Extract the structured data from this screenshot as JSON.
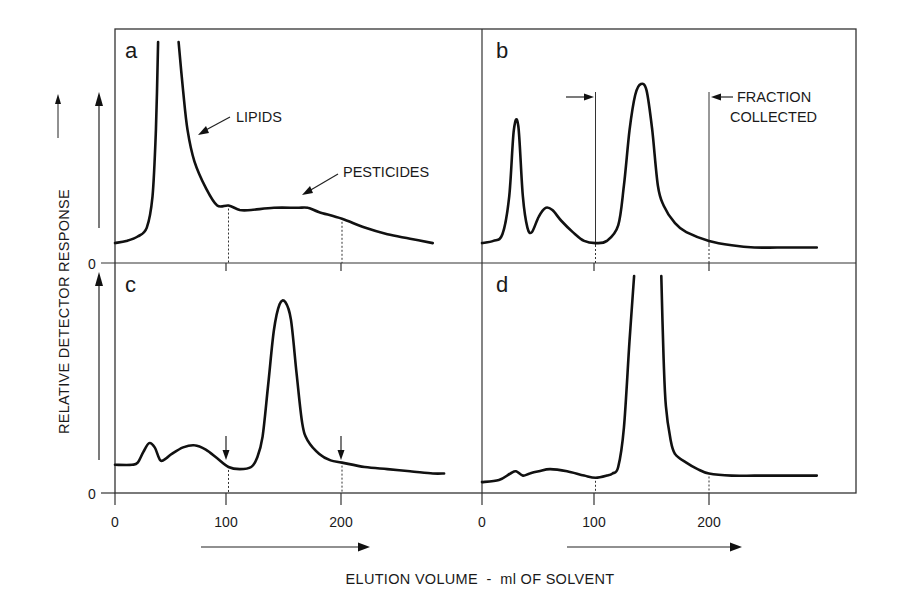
{
  "figure": {
    "ylabel": "RELATIVE DETECTOR RESPONSE",
    "xlabel": "ELUTION VOLUME  -  ml OF SOLVENT",
    "y_zero_label": "0",
    "x_tick_labels": [
      "0",
      "100",
      "200"
    ]
  },
  "panels": {
    "a": {
      "letter": "a",
      "annotations": {
        "lipids": "LIPIDS",
        "pesticides": "PESTICIDES"
      }
    },
    "b": {
      "letter": "b",
      "annotations": {
        "fraction_line1": "FRACTION",
        "fraction_line2": "COLLECTED"
      }
    },
    "c": {
      "letter": "c"
    },
    "d": {
      "letter": "d"
    }
  },
  "colors": {
    "ink": "#111111",
    "frame": "#333333",
    "background": "#ffffff"
  },
  "chart_data": [
    {
      "type": "line",
      "panel": "a",
      "title": "a",
      "xlabel": "ELUTION VOLUME - ml OF SOLVENT",
      "ylabel": "RELATIVE DETECTOR RESPONSE",
      "xlim": [
        0,
        300
      ],
      "ylim": [
        0,
        100
      ],
      "xticks": [
        0,
        100,
        200
      ],
      "annotations": [
        {
          "text": "LIPIDS",
          "x": 70,
          "y": 60
        },
        {
          "text": "PESTICIDES",
          "x": 165,
          "y": 26
        }
      ],
      "guides": [
        {
          "x": 100,
          "style": "dotted"
        },
        {
          "x": 200,
          "style": "dotted"
        }
      ],
      "series": [
        {
          "name": "a",
          "clipped_top": true,
          "x": [
            0,
            10,
            20,
            28,
            33,
            36,
            38,
            42,
            56,
            60,
            64,
            70,
            80,
            90,
            100,
            110,
            120,
            140,
            160,
            170,
            180,
            200,
            220,
            240,
            260,
            280
          ],
          "y": [
            9,
            10,
            12,
            16,
            30,
            60,
            100,
            null,
            100,
            78,
            60,
            46,
            34,
            26,
            26,
            24,
            24,
            25,
            25,
            25,
            23,
            20,
            16,
            13,
            11,
            9
          ]
        }
      ]
    },
    {
      "type": "line",
      "panel": "b",
      "title": "b",
      "xlim": [
        0,
        300
      ],
      "ylim": [
        0,
        100
      ],
      "xticks": [
        0,
        100,
        200
      ],
      "annotations": [
        {
          "text": "FRACTION COLLECTED",
          "x_range": [
            100,
            200
          ]
        }
      ],
      "guides": [
        {
          "x": 100,
          "style": "solid"
        },
        {
          "x": 200,
          "style": "solid"
        }
      ],
      "series": [
        {
          "name": "b",
          "x": [
            0,
            10,
            18,
            24,
            28,
            32,
            36,
            40,
            44,
            50,
            56,
            62,
            70,
            80,
            90,
            100,
            110,
            120,
            125,
            130,
            135,
            140,
            145,
            150,
            155,
            160,
            170,
            180,
            200,
            220,
            240,
            260,
            280,
            295
          ],
          "y": [
            9,
            10,
            13,
            30,
            60,
            62,
            30,
            16,
            14,
            21,
            25,
            24,
            19,
            14,
            10,
            9,
            10,
            17,
            35,
            60,
            76,
            81,
            78,
            60,
            35,
            26,
            18,
            14,
            10,
            8,
            7,
            7,
            7,
            7
          ]
        }
      ]
    },
    {
      "type": "line",
      "panel": "c",
      "title": "c",
      "xlim": [
        0,
        300
      ],
      "ylim": [
        0,
        100
      ],
      "xticks": [
        0,
        100,
        200
      ],
      "annotations": [
        {
          "text": "down-arrow",
          "x": 100
        },
        {
          "text": "down-arrow",
          "x": 200
        }
      ],
      "guides": [
        {
          "x": 100,
          "style": "dotted"
        },
        {
          "x": 200,
          "style": "dotted"
        }
      ],
      "series": [
        {
          "name": "c",
          "x": [
            0,
            15,
            20,
            25,
            30,
            35,
            40,
            45,
            50,
            60,
            70,
            80,
            90,
            100,
            110,
            120,
            125,
            130,
            135,
            140,
            145,
            150,
            155,
            160,
            165,
            170,
            180,
            190,
            200,
            220,
            240,
            260,
            280,
            290
          ],
          "y": [
            13,
            13,
            14,
            19,
            23,
            21,
            15,
            16,
            18,
            21,
            22,
            20,
            16,
            12,
            11,
            12,
            16,
            26,
            50,
            75,
            87,
            88,
            80,
            55,
            32,
            24,
            18,
            15,
            14,
            12,
            11,
            10,
            9,
            9
          ]
        }
      ]
    },
    {
      "type": "line",
      "panel": "d",
      "title": "d",
      "xlim": [
        0,
        300
      ],
      "ylim": [
        0,
        100
      ],
      "xticks": [
        0,
        100,
        200
      ],
      "guides": [
        {
          "x": 100,
          "style": "dotted"
        },
        {
          "x": 200,
          "style": "dotted"
        }
      ],
      "series": [
        {
          "name": "d",
          "clipped_top": true,
          "x": [
            0,
            15,
            25,
            30,
            36,
            42,
            50,
            60,
            75,
            90,
            100,
            110,
            115,
            120,
            125,
            130,
            134,
            136,
            158,
            160,
            162,
            166,
            170,
            180,
            190,
            200,
            220,
            240,
            260,
            280,
            295
          ],
          "y": [
            5,
            6,
            9,
            10,
            8,
            9,
            10,
            11,
            10,
            8,
            7,
            8,
            9,
            12,
            30,
            70,
            100,
            null,
            100,
            62,
            40,
            25,
            18,
            14,
            11,
            9,
            8,
            8,
            8,
            8,
            8
          ]
        }
      ]
    }
  ]
}
